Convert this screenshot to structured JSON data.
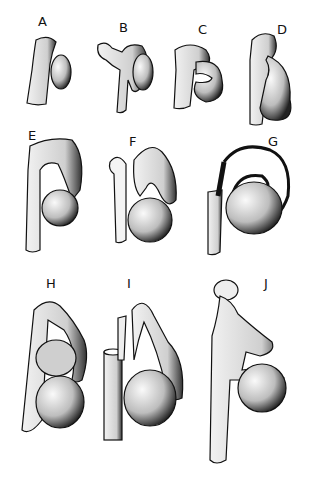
{
  "figure": {
    "panels": [
      {
        "id": "A",
        "label": "A"
      },
      {
        "id": "B",
        "label": "B"
      },
      {
        "id": "C",
        "label": "C"
      },
      {
        "id": "D",
        "label": "D"
      },
      {
        "id": "E",
        "label": "E"
      },
      {
        "id": "F",
        "label": "F"
      },
      {
        "id": "G",
        "label": "G"
      },
      {
        "id": "H",
        "label": "H"
      },
      {
        "id": "I",
        "label": "I"
      },
      {
        "id": "J",
        "label": "J"
      }
    ],
    "colors": {
      "background": "#ffffff",
      "ink": "#111111",
      "shade": "#555555",
      "fill": "#f4f4f4"
    }
  }
}
